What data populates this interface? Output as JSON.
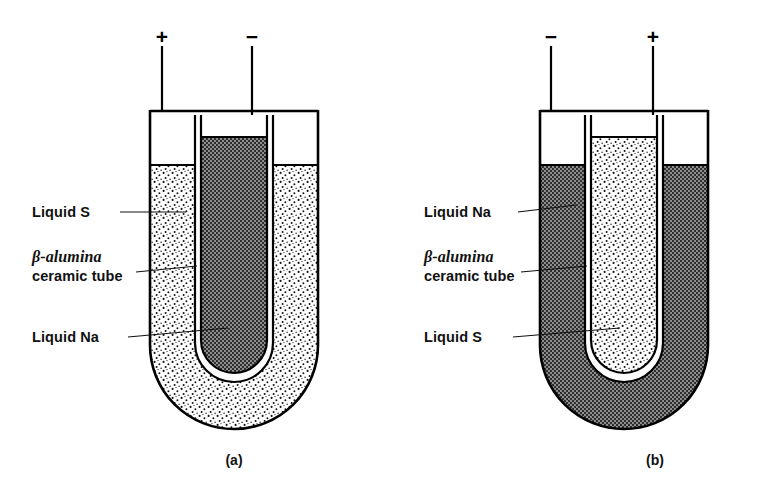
{
  "figure": {
    "colors": {
      "ink": "#111111",
      "stroke": "#000000",
      "dark_fill": "#6b6b6b",
      "light_fill": "#ffffff",
      "page_background": "#ffffff"
    }
  },
  "cells": [
    {
      "caption": "(a)",
      "terminals": {
        "left": {
          "sign": "+",
          "name": "positive"
        },
        "center": {
          "sign": "−",
          "name": "negative"
        }
      },
      "labels": [
        {
          "id": "outer",
          "lines": [
            "Liquid S"
          ]
        },
        {
          "id": "tube",
          "lines": [
            "β-alumina",
            "ceramic tube"
          ]
        },
        {
          "id": "inner",
          "lines": [
            "Liquid Na"
          ]
        }
      ],
      "regions": {
        "outer_annulus": {
          "content": "Liquid S",
          "fill": "light-stipple"
        },
        "inner_tube": {
          "content": "Liquid Na",
          "fill": "dark-hatch"
        }
      }
    },
    {
      "caption": "(b)",
      "terminals": {
        "left": {
          "sign": "−",
          "name": "negative"
        },
        "center": {
          "sign": "+",
          "name": "positive"
        }
      },
      "labels": [
        {
          "id": "outer",
          "lines": [
            "Liquid Na"
          ]
        },
        {
          "id": "tube",
          "lines": [
            "β-alumina",
            "ceramic tube"
          ]
        },
        {
          "id": "inner",
          "lines": [
            "Liquid S"
          ]
        }
      ],
      "regions": {
        "outer_annulus": {
          "content": "Liquid Na",
          "fill": "dark-hatch"
        },
        "inner_tube": {
          "content": "Liquid S",
          "fill": "light-stipple"
        }
      }
    }
  ]
}
